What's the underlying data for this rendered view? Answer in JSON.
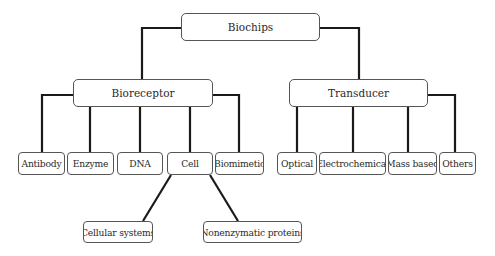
{
  "diagram": {
    "type": "hierarchy",
    "root": {
      "label": "Biochips"
    },
    "level1": [
      {
        "label": "Bioreceptor"
      },
      {
        "label": "Transducer"
      }
    ],
    "bioreceptor_children": [
      {
        "label": "Antibody"
      },
      {
        "label": "Enzyme"
      },
      {
        "label": "DNA"
      },
      {
        "label": "Cell"
      },
      {
        "label": "Biomimetic"
      }
    ],
    "transducer_children": [
      {
        "label": "Optical"
      },
      {
        "label": "Electrochemical"
      },
      {
        "label": "Mass based"
      },
      {
        "label": "Others"
      }
    ],
    "cell_children": [
      {
        "label": "Cellular systems"
      },
      {
        "label": "Nonenzymatic proteins"
      }
    ],
    "colors": {
      "line": "#1a1a1a",
      "border": "#555555",
      "text": "#2a2a2a",
      "background": "#ffffff"
    }
  }
}
